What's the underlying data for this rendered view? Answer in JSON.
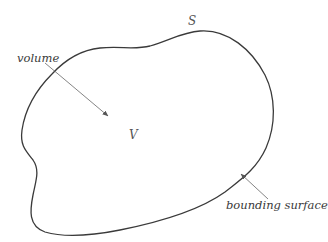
{
  "diagram": {
    "labels": {
      "volume": "volume",
      "surface_symbol": "S",
      "volume_symbol": "V",
      "bounding_surface": "bounding surface"
    },
    "colors": {
      "outline": "#3a3a3a",
      "arrow": "#666666",
      "background": "#ffffff"
    }
  }
}
